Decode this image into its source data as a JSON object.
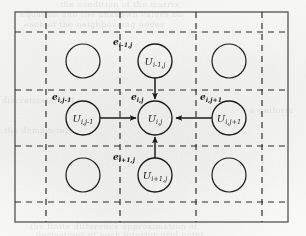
{
  "figure": {
    "background_color": "#fbfbfa",
    "ink_color": "#1d1d1d",
    "border": {
      "style": "solid",
      "x": 15,
      "y": 12,
      "width": 273,
      "height": 210
    },
    "grid": {
      "style": "dashed",
      "vertical_lines": [
        46,
        120,
        196,
        262
      ],
      "horizontal_lines": [
        32,
        90,
        146,
        202
      ]
    },
    "nodes": [
      {
        "id": "center",
        "label_base": "U",
        "label_sub": "i,j",
        "cx": 155,
        "cy": 118,
        "r": 17,
        "filled": false,
        "labelled": true
      },
      {
        "id": "up",
        "label_base": "U",
        "label_sub": "i-1,j",
        "cx": 155,
        "cy": 61,
        "r": 17,
        "filled": false,
        "labelled": true
      },
      {
        "id": "down",
        "label_base": "U",
        "label_sub": "i+1,j",
        "cx": 155,
        "cy": 175,
        "r": 17,
        "filled": false,
        "labelled": true
      },
      {
        "id": "left",
        "label_base": "U",
        "label_sub": "i,j-1",
        "cx": 83,
        "cy": 118,
        "r": 17,
        "filled": false,
        "labelled": true
      },
      {
        "id": "right",
        "label_base": "U",
        "label_sub": "i,j+1",
        "cx": 229,
        "cy": 118,
        "r": 17,
        "filled": false,
        "labelled": true
      },
      {
        "id": "top-left",
        "label_base": "",
        "label_sub": "",
        "cx": 83,
        "cy": 61,
        "r": 17,
        "filled": false,
        "labelled": false
      },
      {
        "id": "top-right",
        "label_base": "",
        "label_sub": "",
        "cx": 229,
        "cy": 61,
        "r": 17,
        "filled": false,
        "labelled": false
      },
      {
        "id": "bottom-left",
        "label_base": "",
        "label_sub": "",
        "cx": 83,
        "cy": 175,
        "r": 17,
        "filled": false,
        "labelled": false
      },
      {
        "id": "bottom-right",
        "label_base": "",
        "label_sub": "",
        "cx": 229,
        "cy": 175,
        "r": 17,
        "filled": false,
        "labelled": false
      }
    ],
    "edge_labels": [
      {
        "id": "e-center",
        "base": "e",
        "sub": "i,j",
        "x": 131,
        "y": 100
      },
      {
        "id": "e-up",
        "base": "e",
        "sub": "i-1,j",
        "x": 113,
        "y": 45
      },
      {
        "id": "e-down",
        "base": "e",
        "sub": "i+1,j",
        "x": 113,
        "y": 160
      },
      {
        "id": "e-left",
        "base": "e",
        "sub": "i,j-1",
        "x": 52,
        "y": 100
      },
      {
        "id": "e-right",
        "base": "e",
        "sub": "i,j+1",
        "x": 200,
        "y": 100
      }
    ],
    "arrows": [
      {
        "id": "arrow-from-up",
        "from": "up",
        "to": "center",
        "direction": "down"
      },
      {
        "id": "arrow-from-down",
        "from": "down",
        "to": "center",
        "direction": "up"
      },
      {
        "id": "arrow-from-left",
        "from": "left",
        "to": "center",
        "direction": "right"
      },
      {
        "id": "arrow-from-right",
        "from": "right",
        "to": "center",
        "direction": "left"
      }
    ],
    "background_text_fragments": [
      {
        "id": "bg-1",
        "x": 60,
        "y": 4,
        "text": "the condition of the matrix"
      },
      {
        "id": "bg-2",
        "x": 20,
        "y": 14,
        "text": "equation and the unknown values on"
      },
      {
        "id": "bg-3",
        "x": 24,
        "y": 24,
        "text": "each of the neighbouring nodes"
      },
      {
        "id": "bg-4",
        "x": 12,
        "y": 100,
        "text": "discretisation of"
      },
      {
        "id": "bg-5",
        "x": 14,
        "y": 130,
        "text": "the domain into"
      },
      {
        "id": "bg-6",
        "x": 200,
        "y": 110,
        "text": "a uniform"
      },
      {
        "id": "bg-7",
        "x": 30,
        "y": 226,
        "text": "the finite difference approximation of"
      },
      {
        "id": "bg-8",
        "x": 36,
        "y": 234,
        "text": "derivatives at each interior grid point"
      }
    ]
  }
}
